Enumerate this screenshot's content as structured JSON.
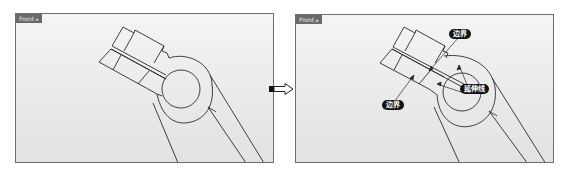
{
  "left_viewport": {
    "tab_label": "Front",
    "tab_caret": "▸"
  },
  "right_viewport": {
    "tab_label": "Front",
    "tab_caret": "▸",
    "callouts": {
      "boundary_top": "边界",
      "extension_line": "延伸线",
      "boundary_bottom": "边界"
    }
  },
  "transition_arrow": "arrow-right-icon",
  "colors": {
    "viewport_bg_top": "#f4f4f4",
    "viewport_bg_bottom": "#e2e2e2",
    "frame": "#6e6e6e",
    "tab_bg": "#6a6a6a",
    "line": "#2a2a2a",
    "callout_bg": "#111111"
  }
}
